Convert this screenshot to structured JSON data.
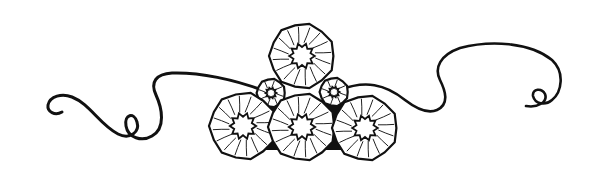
{
  "image": {
    "description": "Decorative ornamental divider: a cluster of six stylized rosette flowers with calligraphic swirling flourishes on both sides",
    "background": "#ffffff",
    "ink_color": "#111111"
  },
  "ornament": {
    "rosettes": [
      {
        "name": "top",
        "cx": 302,
        "cy": 56,
        "r": 32
      },
      {
        "name": "small-left",
        "cx": 271,
        "cy": 93,
        "r": 14
      },
      {
        "name": "small-right",
        "cx": 334,
        "cy": 92,
        "r": 14
      },
      {
        "name": "bottom-left",
        "cx": 243,
        "cy": 126,
        "r": 33
      },
      {
        "name": "bottom-center",
        "cx": 302,
        "cy": 127,
        "r": 33
      },
      {
        "name": "bottom-right",
        "cx": 365,
        "cy": 128,
        "r": 32
      }
    ],
    "flourishes": [
      "left-swirl",
      "right-swirl"
    ]
  }
}
